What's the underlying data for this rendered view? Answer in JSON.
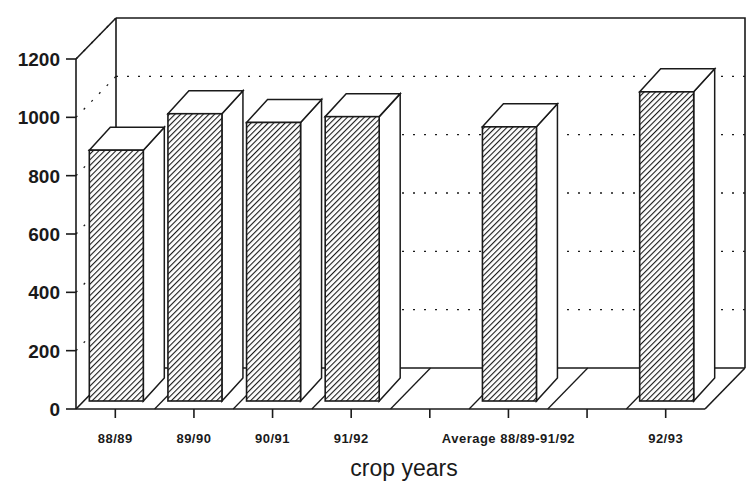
{
  "chart_data": {
    "type": "bar",
    "style": "3d",
    "title": "",
    "xlabel": "crop years",
    "ylabel": "",
    "ylim": [
      0,
      1200
    ],
    "yticks": [
      0,
      200,
      400,
      600,
      800,
      1000,
      1200
    ],
    "grid": "dotted horizontal lines on back wall",
    "legend": "none",
    "categories": [
      "88/89",
      "89/90",
      "90/91",
      "91/92",
      "",
      "Average 88/89-91/92",
      "",
      "92/93"
    ],
    "values": [
      860,
      985,
      955,
      975,
      null,
      940,
      null,
      1060
    ],
    "bar_fill": "diagonal hatch",
    "colors": {
      "ink": "#1a1a1a",
      "background": "#ffffff"
    }
  }
}
